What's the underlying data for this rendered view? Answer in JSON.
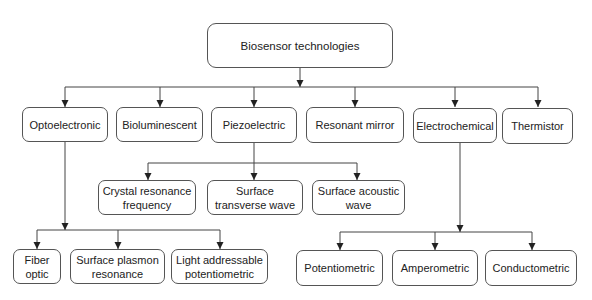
{
  "diagram": {
    "title": "Biosensor technologies",
    "colors": {
      "line": "#444444",
      "border": "#555555",
      "text": "#222222",
      "background": "#ffffff"
    },
    "root": {
      "id": "root",
      "label": "Biosensor technologies",
      "box": [
        207,
        23,
        186,
        45
      ]
    },
    "level1": [
      {
        "id": "optoelectronic",
        "label": "Optoelectronic",
        "box": [
          22,
          107,
          86,
          35
        ]
      },
      {
        "id": "bioluminescent",
        "label": "Bioluminescent",
        "box": [
          116,
          107,
          87,
          35
        ]
      },
      {
        "id": "piezoelectric",
        "label": "Piezoelectric",
        "box": [
          211,
          107,
          86,
          36
        ]
      },
      {
        "id": "resonant-mirror",
        "label": "Resonant mirror",
        "box": [
          306,
          107,
          98,
          36
        ]
      },
      {
        "id": "electrochemical",
        "label": "Electrochemical",
        "box": [
          413,
          108,
          84,
          35
        ]
      },
      {
        "id": "thermistor",
        "label": "Thermistor",
        "box": [
          502,
          108,
          71,
          36
        ]
      }
    ],
    "piezoelectric_children": [
      {
        "id": "crystal-resonance-frequency",
        "label": "Crystal resonance frequency",
        "box": [
          98,
          180,
          98,
          35
        ]
      },
      {
        "id": "surface-transverse-wave",
        "label": "Surface transverse wave",
        "box": [
          207,
          180,
          96,
          35
        ]
      },
      {
        "id": "surface-acoustic-wave",
        "label": "Surface acoustic wave",
        "box": [
          312,
          180,
          93,
          35
        ]
      }
    ],
    "optoelectronic_children": [
      {
        "id": "fiber-optic",
        "label": "Fiber optic",
        "box": [
          13,
          249,
          48,
          35
        ]
      },
      {
        "id": "surface-plasmon-resonance",
        "label": "Surface plasmon resonance",
        "box": [
          70,
          249,
          95,
          35
        ]
      },
      {
        "id": "light-addressable-potentiometric",
        "label": "Light addressable potentiometric",
        "box": [
          171,
          249,
          97,
          35
        ]
      }
    ],
    "electrochemical_children": [
      {
        "id": "potentiometric",
        "label": "Potentiometric",
        "box": [
          296,
          250,
          87,
          36
        ]
      },
      {
        "id": "amperometric",
        "label": "Amperometric",
        "box": [
          392,
          250,
          86,
          36
        ]
      },
      {
        "id": "conductometric",
        "label": "Conductometric",
        "box": [
          485,
          250,
          92,
          36
        ]
      }
    ],
    "connectors": [
      {
        "from": "root",
        "trunk": [
          300,
          68,
          300,
          87
        ],
        "bus_y": 87,
        "bus_x": [
          65,
          538
        ],
        "drops_x": [
          65,
          160,
          254,
          355,
          455,
          538
        ],
        "drop_to_y": 107,
        "trunk_arrow": true
      },
      {
        "from": "piezoelectric",
        "trunk": [
          254,
          143,
          254,
          163
        ],
        "bus_y": 163,
        "bus_x": [
          148,
          357
        ],
        "drops_x": [
          148,
          254,
          357
        ],
        "drop_to_y": 180,
        "trunk_arrow": false
      },
      {
        "from": "optoelectronic",
        "trunk": [
          65,
          142,
          65,
          230
        ],
        "bus_y": 230,
        "bus_x": [
          37,
          220
        ],
        "drops_x": [
          37,
          118,
          220
        ],
        "drop_to_y": 249,
        "trunk_arrow": true
      },
      {
        "from": "electrochemical",
        "trunk": [
          460,
          143,
          460,
          232
        ],
        "bus_y": 232,
        "bus_x": [
          340,
          532
        ],
        "drops_x": [
          340,
          435,
          532
        ],
        "drop_to_y": 250,
        "trunk_arrow": true
      }
    ]
  }
}
